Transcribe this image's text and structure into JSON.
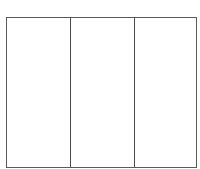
{
  "diagram": {
    "type": "three-panel-frame",
    "line_color": "#5a5a5a",
    "background_color": "#ffffff",
    "panels": [
      {
        "label": ""
      },
      {
        "label": ""
      },
      {
        "label": ""
      }
    ]
  }
}
